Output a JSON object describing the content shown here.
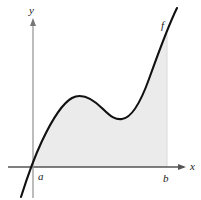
{
  "figure": {
    "kind": "area-under-curve-diagram",
    "background_color": "#ffffff",
    "axes": {
      "x_axis_label": "x",
      "y_axis_label": "y",
      "axis_color": "#555555",
      "axis_origin_px": {
        "x": 33,
        "y": 167
      },
      "x_axis_extent_px": {
        "from": 8,
        "to": 186
      },
      "y_axis_extent_px": {
        "from": 18,
        "to": 198
      },
      "x_label_pos_px": {
        "x": 190,
        "y": 170
      },
      "y_label_pos_px": {
        "x": 29,
        "y": 14
      }
    },
    "curve": {
      "label": "f",
      "label_pos_px": {
        "x": 161,
        "y": 29
      },
      "stroke_color": "#111111",
      "stroke_width": 2.1,
      "path": "M 21 197 C 27 178, 33 160, 42 141 C 51 122, 61 104, 72 98 C 83 92, 94 100, 103 109 C 111 117, 116 120, 122 119 C 131 118, 140 104, 149 79 C 158 54, 168 26, 177 8",
      "description": "cubic-like curve rising from lower left, local maximum, local minimum, then steeply increasing"
    },
    "shaded_region": {
      "fill_color": "#ebebeb",
      "label": "region bounded by curve, x-axis, and vertical line at b",
      "path": "M 33 167 L 33 160 C 33 160, 37 150, 42 141 C 51 122, 61 104, 72 98 C 83 92, 94 100, 103 109 C 111 117, 116 120, 122 119 C 131 118, 140 104, 149 79 C 155 64, 161 47, 167 32 L 167 167 Z",
      "right_boundary_px": {
        "x": 167,
        "from_y": 32,
        "to_y": 167
      }
    },
    "markers": [
      {
        "name": "a",
        "label": "a",
        "pos_px": {
          "x": 38,
          "y": 180
        },
        "axis_x_px": 33
      },
      {
        "name": "b",
        "label": "b",
        "pos_px": {
          "x": 163,
          "y": 182
        },
        "axis_x_px": 167
      }
    ]
  }
}
